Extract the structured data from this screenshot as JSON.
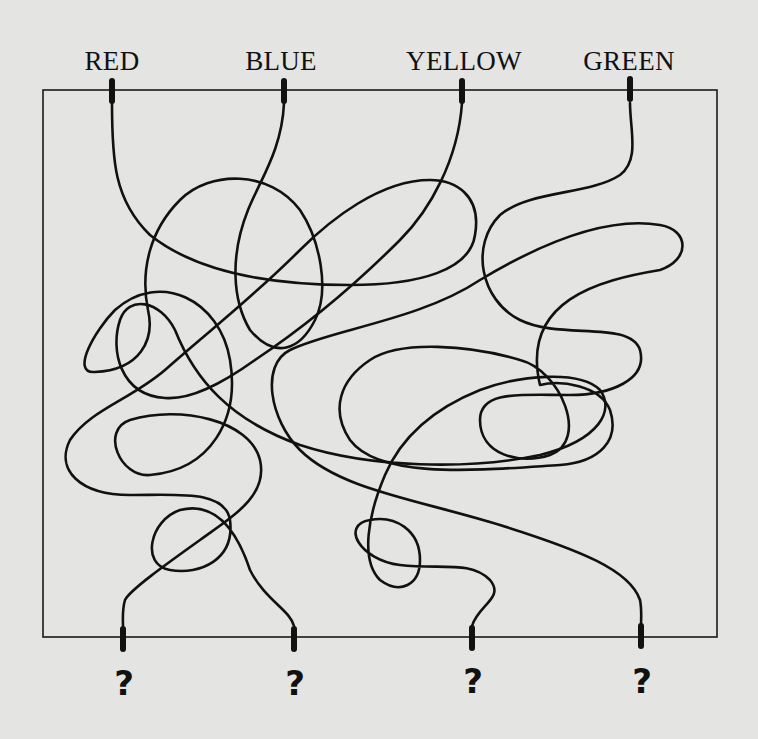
{
  "puzzle": {
    "frame": {
      "x": 43,
      "y": 90,
      "width": 674,
      "height": 547,
      "stroke": "#1a1a1a"
    },
    "background": "#e4e4e2",
    "ink": "#111111",
    "top_connectors": [
      {
        "label": "RED",
        "x": 112,
        "label_x": 112
      },
      {
        "label": "BLUE",
        "x": 284,
        "label_x": 281
      },
      {
        "label": "YELLOW",
        "x": 462,
        "label_x": 464
      },
      {
        "label": "GREEN",
        "x": 630,
        "label_x": 629
      }
    ],
    "bottom_connectors": [
      {
        "label": "?",
        "x": 123
      },
      {
        "label": "?",
        "x": 294
      },
      {
        "label": "?",
        "x": 472
      },
      {
        "label": "?",
        "x": 641
      }
    ],
    "wires": [
      {
        "name": "wire-red",
        "from": "RED",
        "to": "?"
      },
      {
        "name": "wire-blue",
        "from": "BLUE",
        "to": "?"
      },
      {
        "name": "wire-yellow",
        "from": "YELLOW",
        "to": "?"
      },
      {
        "name": "wire-green",
        "from": "GREEN",
        "to": "?"
      }
    ]
  }
}
